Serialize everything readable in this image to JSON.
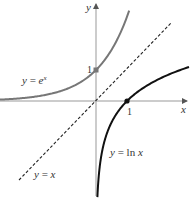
{
  "figure": {
    "axes": {
      "x_label": "x",
      "y_label": "y",
      "x_tick_label": "1",
      "y_tick_label": "1",
      "color": "#999999"
    },
    "curves": [
      {
        "name": "exponential",
        "label_prefix": "y = e",
        "label_superscript": "x",
        "color": "#777777",
        "marked_point": {
          "x": 0,
          "y": 1
        }
      },
      {
        "name": "natural-log",
        "label": "y = ln x",
        "label_y": "y",
        "label_eq": " = ln ",
        "label_x": "x",
        "color": "#111111",
        "marked_point": {
          "x": 1,
          "y": 0
        }
      },
      {
        "name": "identity",
        "label_y": "y",
        "label_eq": " = ",
        "label_x": "x",
        "style": "dashed",
        "color": "#222222"
      }
    ],
    "scale": {
      "origin_px": [
        96,
        101
      ],
      "unit_px": 31
    }
  }
}
